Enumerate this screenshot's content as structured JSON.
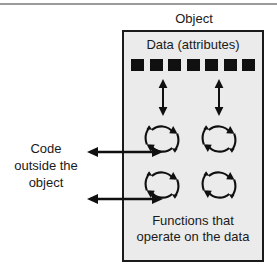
{
  "diagram": {
    "title": "Object",
    "object_box": {
      "data_label": "Data (attributes)",
      "attribute_count": 7,
      "attributes": [
        "attr-1",
        "attr-2",
        "attr-3",
        "attr-4",
        "attr-5",
        "attr-6",
        "attr-7"
      ],
      "functions_label_line1": "Functions that",
      "functions_label_line2": "operate on the data",
      "function_count": 4,
      "function_icon_name": "circular-arrow-icon",
      "fill_color": "#ebebeb",
      "border_color": "#1a1a1a"
    },
    "external": {
      "code_label_line1": "Code",
      "code_label_line2": "outside the",
      "code_label_line3": "object"
    },
    "connectors": {
      "vertical_arrow_name": "double-headed-vertical-arrow",
      "vertical_arrow_count": 2,
      "horizontal_arrow_name": "double-headed-horizontal-arrow",
      "horizontal_arrow_count": 2
    },
    "colors": {
      "ink": "#1a1a1a",
      "panel": "#ebebeb",
      "page": "#ffffff",
      "rule": "#9a9a9a"
    }
  }
}
